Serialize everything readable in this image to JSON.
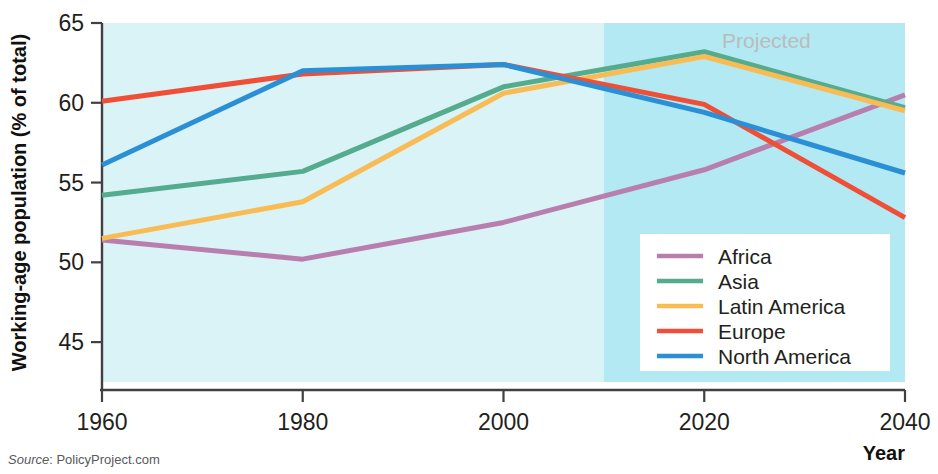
{
  "chart_data": {
    "type": "line",
    "title": "",
    "xlabel": "Year",
    "ylabel": "Working-age population (% of total)",
    "x": [
      1960,
      1980,
      2000,
      2020,
      2040
    ],
    "xtick_labels": [
      "1960",
      "1980",
      "2000",
      "2020",
      "2040"
    ],
    "ytick_labels": [
      "65",
      "60",
      "55",
      "50",
      "45"
    ],
    "ytick_values": [
      65,
      60,
      55,
      50,
      45
    ],
    "xlim": [
      1960,
      2040
    ],
    "ylim": [
      42.5,
      65
    ],
    "grid": false,
    "legend_position": "bottom-right",
    "plot_background": "#d9f3f7",
    "projection_background": "#b3e9f2",
    "projection_start_year": 2010,
    "projection_label": "Projected",
    "series": [
      {
        "name": "Africa",
        "color": "#b87fae",
        "values": [
          51.4,
          50.2,
          52.5,
          55.8,
          60.5
        ]
      },
      {
        "name": "Asia",
        "color": "#54ab8e",
        "values": [
          54.2,
          55.7,
          61.0,
          63.2,
          59.7
        ]
      },
      {
        "name": "Latin America",
        "color": "#f9bc55",
        "values": [
          51.5,
          53.8,
          60.6,
          62.9,
          59.5
        ]
      },
      {
        "name": "Europe",
        "color": "#f04e37",
        "values": [
          60.1,
          61.8,
          62.4,
          59.9,
          52.8
        ]
      },
      {
        "name": "North America",
        "color": "#2b8fd6",
        "values": [
          56.1,
          62.0,
          62.4,
          59.4,
          55.6
        ]
      }
    ]
  },
  "axes": {
    "y_title": "Working-age population (% of total)",
    "x_title": "Year"
  },
  "annotations": {
    "projected": "Projected"
  },
  "legend": {
    "entries": [
      {
        "label": "Africa"
      },
      {
        "label": "Asia"
      },
      {
        "label": "Latin America"
      },
      {
        "label": "Europe"
      },
      {
        "label": "North America"
      }
    ]
  },
  "source": {
    "prefix": "Source",
    "separator": ": ",
    "name": "PolicyProject.com"
  }
}
